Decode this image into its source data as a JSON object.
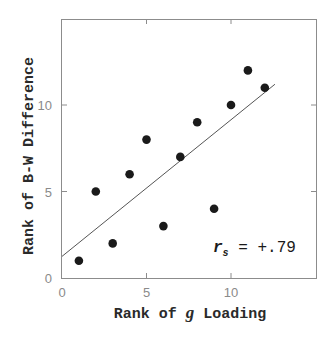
{
  "chart_data": {
    "type": "scatter",
    "title": "",
    "xlabel_parts": [
      "Rank of ",
      "g",
      " Loading"
    ],
    "xlabel": "Rank of g Loading",
    "ylabel": "Rank of B-W Difference",
    "xlim": [
      0,
      14.9
    ],
    "ylim": [
      0,
      15
    ],
    "x_ticks": [
      0,
      5,
      10
    ],
    "y_ticks": [
      0,
      5,
      10
    ],
    "grid": false,
    "legend": null,
    "points": [
      {
        "x": 1,
        "y": 1
      },
      {
        "x": 2,
        "y": 5
      },
      {
        "x": 3,
        "y": 2
      },
      {
        "x": 4,
        "y": 6
      },
      {
        "x": 5,
        "y": 8
      },
      {
        "x": 6,
        "y": 3
      },
      {
        "x": 7,
        "y": 7
      },
      {
        "x": 8,
        "y": 9
      },
      {
        "x": 9,
        "y": 4
      },
      {
        "x": 10,
        "y": 10
      },
      {
        "x": 11,
        "y": 12
      },
      {
        "x": 12,
        "y": 11
      }
    ],
    "regression_line": {
      "x0": 0,
      "y0": 1.25,
      "x1": 12.6,
      "y1": 11.2
    },
    "annotation": {
      "symbol": "r",
      "subscript": "s",
      "text": " = +.79"
    },
    "colors": {
      "points": "#1a1a1a",
      "line": "#555555",
      "axes": "#8c8c8c",
      "ticks": "#8a8a8a"
    }
  }
}
